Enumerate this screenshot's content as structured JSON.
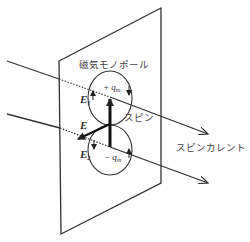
{
  "diagram": {
    "labels": {
      "monopole": "磁気モノポール",
      "spin": "スピン",
      "spin_current": "スピンカレント",
      "plus_q_sign": "+",
      "plus_q": "q",
      "plus_q_sub": "m",
      "minus_q_sign": "−",
      "minus_q": "q",
      "minus_q_sub": "m",
      "E": "E",
      "E1": "E",
      "E1_sub": "1",
      "E2": "E",
      "E2_sub": "2"
    },
    "colors": {
      "line": "#333333",
      "text": "#444444",
      "background": "#ffffff"
    }
  }
}
